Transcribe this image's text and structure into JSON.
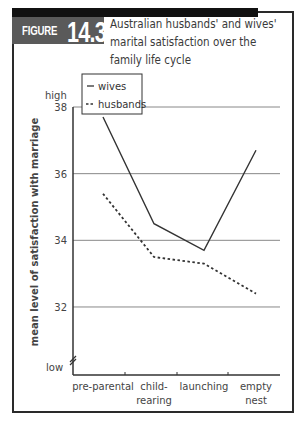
{
  "figure": {
    "label": "FIGURE",
    "number": "14.3",
    "title_lines": [
      "Australian husbands' and wives'",
      "marital satisfaction over the",
      "family life cycle"
    ]
  },
  "colors": {
    "frame": "#2a2a2a",
    "badge": "#5a5a5a",
    "gridline": "#888888",
    "series_line": "#333333"
  },
  "chart_data": {
    "type": "line",
    "title": "Australian husbands' and wives' marital satisfaction over the family life cycle",
    "xlabel": "",
    "ylabel": "mean level of satisfaction with marriage",
    "categories": [
      "pre-parental",
      "child-rearing",
      "launching",
      "empty nest"
    ],
    "category_labels": [
      [
        "pre-parental"
      ],
      [
        "child-",
        "rearing"
      ],
      [
        "launching"
      ],
      [
        "empty",
        "nest"
      ]
    ],
    "series": [
      {
        "name": "wives",
        "style": "solid",
        "values": [
          37.7,
          34.5,
          33.7,
          36.7
        ]
      },
      {
        "name": "husbands",
        "style": "dashed",
        "values": [
          35.4,
          33.5,
          33.3,
          32.4
        ]
      }
    ],
    "yticks": [
      32,
      34,
      36,
      38
    ],
    "ytick_labels": [
      "32",
      "34",
      "36",
      "38"
    ],
    "y_extra_labels": {
      "top": "high",
      "bottom": "low"
    },
    "ylim": [
      30.0,
      38.0
    ],
    "axis_break": true,
    "grid": {
      "horizontal": true,
      "vertical": false
    },
    "legend": {
      "position": "top-left",
      "entries": [
        {
          "symbol": "—",
          "label": "wives"
        },
        {
          "symbol": "--",
          "label": "husbands"
        }
      ]
    }
  }
}
